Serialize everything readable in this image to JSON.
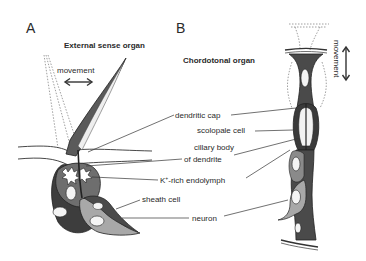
{
  "figure": {
    "panels": [
      {
        "letter": "A",
        "title": "External sense organ",
        "movement_label": "movement",
        "movement_direction": "horizontal"
      },
      {
        "letter": "B",
        "title": "Chordotonal organ",
        "movement_label": "movement",
        "movement_direction": "vertical"
      }
    ],
    "labels": {
      "dendritic_cap": "dendritic cap",
      "scolopale_cell": "scolopale cell",
      "ciliary_body_line1": "cillary body",
      "ciliary_body_line2": "of dendrite",
      "endolymph_prefix": "K",
      "endolymph_sup": "+",
      "endolymph_suffix": "-rich endolymph",
      "sheath_cell": "sheath cell",
      "neuron": "neuron"
    },
    "colors": {
      "dark_cell": "#4a4a4a",
      "mid_cell": "#6e6e6e",
      "light_cell": "#a8a8a8",
      "outline": "#222222",
      "background": "#ffffff",
      "dashed": "#888888"
    }
  }
}
